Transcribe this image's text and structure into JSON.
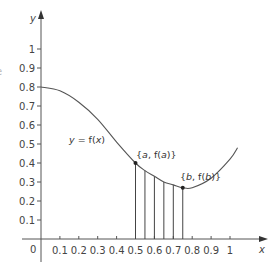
{
  "chart_data": {
    "type": "line",
    "title": "",
    "xlabel": "x",
    "ylabel": "y",
    "xlim": [
      0,
      1.1
    ],
    "ylim": [
      0,
      1.1
    ],
    "grid": false,
    "legend": null,
    "x_ticks": [
      "0.1",
      "0.2",
      "0.3",
      "0.4",
      "0.5",
      "0.6",
      "0.7",
      "0.8",
      "0.9",
      "1"
    ],
    "y_ticks": [
      "0.1",
      "0.2",
      "0.3",
      "0.4",
      "0.5",
      "0.6",
      "0.7",
      "0.8",
      "0.9",
      "1"
    ],
    "origin_label": "0",
    "series": [
      {
        "name": "y = f(x)",
        "x": [
          0,
          0.1,
          0.2,
          0.3,
          0.4,
          0.5,
          0.55,
          0.6,
          0.65,
          0.7,
          0.75,
          0.8,
          0.9,
          1.0,
          1.04
        ],
        "y": [
          0.8,
          0.78,
          0.72,
          0.63,
          0.51,
          0.4,
          0.36,
          0.33,
          0.3,
          0.285,
          0.27,
          0.27,
          0.32,
          0.42,
          0.48
        ]
      }
    ],
    "vertical_lines_x": [
      0.5,
      0.55,
      0.6,
      0.65,
      0.7,
      0.75
    ],
    "points": [
      {
        "label": "{a, f(a)}",
        "x": 0.5,
        "y": 0.4
      },
      {
        "label": "{b, f(b)}",
        "x": 0.75,
        "y": 0.27
      }
    ],
    "annotations": [
      {
        "text": "y = f(x)",
        "x": 0.15,
        "y": 0.52
      },
      {
        "text": "{a, f(a)}",
        "x": 0.5,
        "y": 0.44
      },
      {
        "text": "{b, f(b)}",
        "x": 0.76,
        "y": 0.31
      }
    ]
  },
  "labels": {
    "x_axis": "x",
    "y_axis": "y",
    "origin": "0",
    "curve": "y = f(x)",
    "point_a": "{a, f(a)}",
    "point_b": "{b, f(b)}"
  },
  "colors": {
    "axis": "#555555",
    "curve": "#555555",
    "text": "#444444",
    "point": "#222222"
  }
}
